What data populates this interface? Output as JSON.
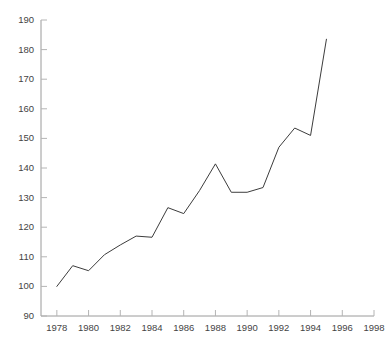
{
  "chart_data": {
    "type": "line",
    "title": "",
    "xlabel": "",
    "ylabel": "",
    "xlim": [
      1977,
      1998
    ],
    "ylim": [
      90,
      190
    ],
    "grid": false,
    "legend": null,
    "xticks": [
      1978,
      1980,
      1982,
      1984,
      1986,
      1988,
      1990,
      1992,
      1994,
      1996,
      1998
    ],
    "yticks": [
      90,
      100,
      110,
      120,
      130,
      140,
      150,
      160,
      170,
      180,
      190
    ],
    "xtick_labels": [
      "1978",
      "1980",
      "1982",
      "1984",
      "1986",
      "1988",
      "1990",
      "1992",
      "1994",
      "1996",
      "1998"
    ],
    "ytick_labels": [
      "90",
      "100",
      "110",
      "120",
      "130",
      "140",
      "150",
      "160",
      "170",
      "180",
      "190"
    ],
    "series": [
      {
        "name": "series-1",
        "color": "#3c3c3c",
        "line_width": 1,
        "x": [
          1978,
          1979,
          1980,
          1981,
          1982,
          1983,
          1984,
          1985,
          1986,
          1987,
          1988,
          1989,
          1990,
          1991,
          1992,
          1993,
          1994,
          1995
        ],
        "values": [
          100.0,
          107.0,
          105.3,
          110.7,
          114.0,
          117.0,
          116.6,
          126.6,
          124.6,
          132.4,
          141.4,
          131.8,
          131.8,
          133.4,
          147.0,
          153.5,
          151.0,
          183.5
        ]
      }
    ]
  },
  "axes": {
    "spine_color": "#9a9a9a",
    "tick_color": "#b4b4b4",
    "label_color": "#444444"
  }
}
